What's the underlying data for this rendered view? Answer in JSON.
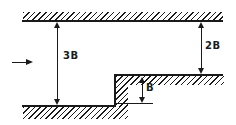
{
  "diagram": {
    "colors": {
      "ink": "#1a1a1a",
      "background": "#ffffff"
    },
    "flow": {
      "icon": "right-arrow-icon"
    },
    "dimensions": {
      "inlet": {
        "label": "3B"
      },
      "outlet": {
        "label": "2B"
      },
      "step": {
        "label": "B"
      }
    }
  }
}
